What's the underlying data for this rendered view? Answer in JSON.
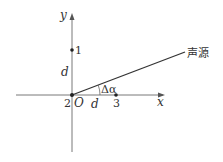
{
  "diagram": {
    "axes": {
      "x_label": "x",
      "y_label": "y",
      "origin_label": "O"
    },
    "points": [
      {
        "id": "1",
        "label": "1",
        "position": "on y-axis at distance d above O"
      },
      {
        "id": "2",
        "label": "2",
        "position": "at origin O"
      },
      {
        "id": "3",
        "label": "3",
        "position": "on x-axis at distance d right of O"
      }
    ],
    "distance_labels": {
      "vertical": "d",
      "horizontal": "d"
    },
    "angle_label": "Δα",
    "source_label": "声源",
    "colors": {
      "line": "#333333",
      "background": "#ffffff"
    }
  }
}
